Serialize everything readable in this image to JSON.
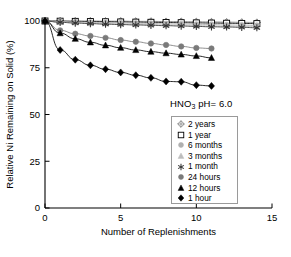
{
  "chart_data": {
    "type": "line",
    "title": "",
    "annotation": "HNO3 pH= 6.0",
    "annotation_parts": {
      "pre": "HNO",
      "sub": "3",
      "post": " pH= 6.0"
    },
    "xlabel": "Number of Replenishments",
    "ylabel": "Relative Ni Remaining on Solid (%)",
    "xlim": [
      0,
      15
    ],
    "ylim": [
      0,
      100
    ],
    "xticks": [
      0,
      5,
      10,
      15
    ],
    "yticks": [
      0,
      25,
      50,
      75,
      100
    ],
    "xtick_labels": [
      "0",
      "5",
      "10",
      "15"
    ],
    "ytick_labels": [
      "0",
      "25",
      "50",
      "75",
      "100"
    ],
    "grid": false,
    "legend_position": "center-right",
    "series": [
      {
        "name": "2 years",
        "marker": "open-cross-diamond",
        "color": "#808080",
        "fill": "#ffffff",
        "x": [
          0,
          1,
          2,
          3,
          4,
          5,
          6,
          7,
          8,
          9,
          10,
          11,
          12,
          13,
          14
        ],
        "values": [
          100,
          100,
          100,
          100,
          99.9,
          99.9,
          99.8,
          99.8,
          99.7,
          99.7,
          99.6,
          99.5,
          99.4,
          99.3,
          99.2
        ]
      },
      {
        "name": "1 year",
        "marker": "open-square",
        "color": "#000000",
        "fill": "#ffffff",
        "x": [
          0,
          1,
          2,
          3,
          4,
          5,
          6,
          7,
          8,
          9,
          10,
          11,
          12,
          13,
          14
        ],
        "values": [
          100,
          99.9,
          99.8,
          99.7,
          99.6,
          99.5,
          99.4,
          99.3,
          99.2,
          99.1,
          99.0,
          98.9,
          98.8,
          98.7,
          98.6
        ]
      },
      {
        "name": "6 months",
        "marker": "filled-circle-light",
        "color": "#b0b0b0",
        "fill": "#b0b0b0",
        "x": [
          0,
          1,
          2,
          3,
          4,
          5,
          6,
          7,
          8,
          9,
          10,
          11,
          12,
          13,
          14
        ],
        "values": [
          100,
          99.7,
          99.5,
          99.3,
          99.1,
          99.0,
          98.8,
          98.7,
          98.5,
          98.4,
          98.2,
          98.1,
          97.9,
          97.8,
          97.6
        ]
      },
      {
        "name": "3 months",
        "marker": "filled-triangle-light",
        "color": "#bdbdbd",
        "fill": "#bdbdbd",
        "x": [
          0,
          1,
          2,
          3,
          4,
          5,
          6,
          7,
          8,
          9,
          10,
          11,
          12,
          13,
          14
        ],
        "values": [
          100,
          99.5,
          99.2,
          98.9,
          98.7,
          98.5,
          98.3,
          98.1,
          97.9,
          97.8,
          97.6,
          97.4,
          97.3,
          97.1,
          97.0
        ]
      },
      {
        "name": "1 month",
        "marker": "star",
        "color": "#333333",
        "fill": "#333333",
        "x": [
          0,
          1,
          2,
          3,
          4,
          5,
          6,
          7,
          8,
          9,
          10,
          11,
          12,
          13,
          14
        ],
        "values": [
          100,
          99.3,
          98.9,
          98.6,
          98.3,
          98.1,
          97.9,
          97.7,
          97.5,
          97.3,
          97.1,
          96.9,
          96.8,
          96.6,
          96.4
        ]
      },
      {
        "name": "24 hours",
        "marker": "filled-circle",
        "color": "#7a7a7a",
        "fill": "#7a7a7a",
        "x": [
          0,
          1,
          2,
          3,
          4,
          5,
          6,
          7,
          8,
          9,
          10,
          11
        ],
        "values": [
          100,
          95.0,
          93.2,
          92.0,
          91.0,
          89.8,
          88.9,
          88.0,
          87.2,
          86.4,
          85.6,
          85.3
        ]
      },
      {
        "name": "12 hours",
        "marker": "filled-triangle",
        "color": "#000000",
        "fill": "#000000",
        "x": [
          0,
          1,
          2,
          3,
          4,
          5,
          6,
          7,
          8,
          9,
          10,
          11
        ],
        "values": [
          100,
          93.5,
          90.5,
          88.6,
          87.0,
          85.7,
          84.5,
          83.6,
          82.8,
          82.1,
          81.3,
          80.3
        ]
      },
      {
        "name": "1 hour",
        "marker": "filled-diamond",
        "color": "#000000",
        "fill": "#000000",
        "x": [
          0,
          1,
          2,
          3,
          4,
          5,
          6,
          7,
          8,
          9,
          10,
          11
        ],
        "values": [
          100,
          84.5,
          79.3,
          76.3,
          74.2,
          72.5,
          71.0,
          69.6,
          67.7,
          67.5,
          65.7,
          65.3
        ]
      }
    ]
  }
}
